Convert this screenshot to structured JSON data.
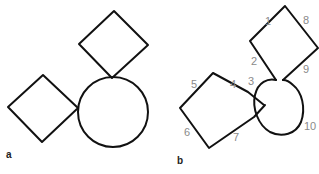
{
  "panels": {
    "a": {
      "label": "a"
    },
    "b": {
      "label": "b",
      "stroke_numbers": [
        "1",
        "2",
        "3",
        "4",
        "5",
        "6",
        "7",
        "8",
        "9",
        "10"
      ]
    }
  },
  "colors": {
    "stroke": "#111111",
    "numbers": "#8a8a8a",
    "background": "#ffffff"
  }
}
